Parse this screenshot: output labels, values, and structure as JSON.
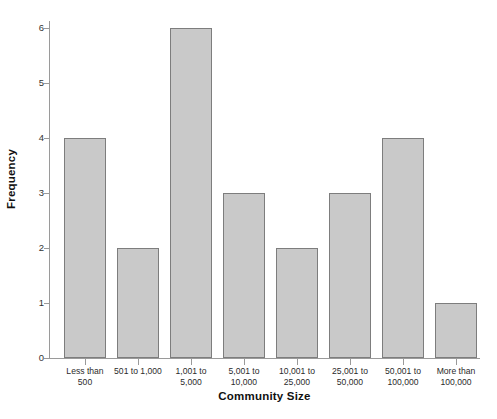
{
  "chart_data": {
    "type": "bar",
    "title": "",
    "xlabel": "Community Size",
    "ylabel": "Frequency",
    "categories": [
      "Less than\n500",
      "501 to 1,000",
      "1,001 to\n5,000",
      "5,001 to\n10,000",
      "10,001 to\n25,000",
      "25,001 to\n50,000",
      "50,001 to\n100,000",
      "More than\n100,000"
    ],
    "values": [
      4,
      2,
      6,
      3,
      2,
      3,
      4,
      1
    ],
    "ylim": [
      0,
      6
    ],
    "yticks": [
      0,
      1,
      2,
      3,
      4,
      5,
      6
    ],
    "ytick_labels": [
      "0",
      "1",
      "2",
      "3",
      "4",
      "5",
      "6"
    ],
    "grid": false,
    "legend": null,
    "bar_color": "#c9c9c9",
    "bar_border_color": "#7d7d7d",
    "axis_color": "#9a9a9a",
    "background": "#ffffff"
  }
}
